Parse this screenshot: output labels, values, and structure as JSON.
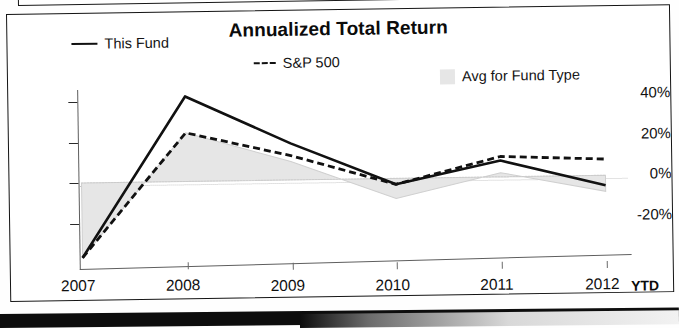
{
  "chart": {
    "title": "Annualized Total Return",
    "ytd_note": "YTD"
  },
  "legend": [
    {
      "key": "this_fund",
      "label": "This Fund",
      "marker": "solid-line",
      "color": "#111111"
    },
    {
      "key": "sp500",
      "label": "S&P 500",
      "marker": "dashed-line",
      "color": "#111111"
    },
    {
      "key": "avg_fund_type",
      "label": "Avg for Fund Type",
      "marker": "filled-square",
      "color": "#e6e6e6"
    }
  ],
  "axis": {
    "y_ticks": [
      "40%",
      "20%",
      "0%",
      "-20%"
    ],
    "x_ticks": [
      "2007",
      "2008",
      "2009",
      "2010",
      "2011",
      "2012"
    ]
  },
  "chart_data": {
    "type": "line",
    "title": "Annualized Total Return",
    "xlabel": "",
    "ylabel": "",
    "categories": [
      "2007",
      "2008",
      "2009",
      "2010",
      "2011",
      "2012"
    ],
    "ylim": [
      -40,
      45
    ],
    "yticks": [
      40,
      20,
      0,
      -20
    ],
    "ytick_labels": [
      "40%",
      "20%",
      "0%",
      "-20%"
    ],
    "grid": false,
    "legend_position": "top",
    "annotations": [
      "YTD"
    ],
    "series": [
      {
        "name": "This Fund",
        "style": "solid",
        "color": "#111111",
        "values": [
          -37,
          42,
          18,
          -3,
          8,
          -5
        ]
      },
      {
        "name": "S&P 500",
        "style": "dashed",
        "color": "#111111",
        "values": [
          -37,
          24,
          12,
          -3,
          10,
          8
        ]
      },
      {
        "name": "Avg for Fund Type",
        "style": "area",
        "color": "#e6e6e6",
        "values": [
          -37,
          24,
          9,
          -10,
          2,
          -8
        ]
      }
    ]
  }
}
